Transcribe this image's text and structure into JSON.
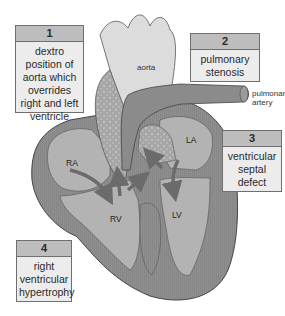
{
  "diagram": {
    "labels": [
      {
        "number": "1",
        "text": "dextro position of aorta which overrides right and left ventricle"
      },
      {
        "number": "2",
        "text": "pulmonary stenosis"
      },
      {
        "number": "3",
        "text": "ventricular septal defect"
      },
      {
        "number": "4",
        "text": "right ventricular hypertrophy"
      }
    ],
    "structures": {
      "aorta": "aorta",
      "pulmonary_artery_line1": "pulmonary",
      "pulmonary_artery_line2": "artery"
    },
    "chambers": {
      "ra": "RA",
      "la": "LA",
      "rv": "RV",
      "lv": "LV"
    },
    "colors": {
      "heart_wall": "#8e8e8e",
      "chamber": "#b3b3b3",
      "aorta": "#dcdcdc",
      "mixed_blood": "#a9a9a9",
      "arrow": "#6b6b6b",
      "box_fill": "#ececec",
      "box_header": "#bdbdbd"
    }
  }
}
